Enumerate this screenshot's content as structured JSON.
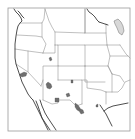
{
  "map": {
    "title": "",
    "colors": {
      "background": "#ffffff",
      "frame": "#9a9a9a",
      "state_border": "#8c8c8c",
      "coastline": "#3a3a3a",
      "shaded_region": "#6e6e6e",
      "lake": "#d8d8d8"
    },
    "frame": {
      "x": 8,
      "y": 8,
      "width": 122,
      "height": 123
    },
    "coastlines": [
      "M14,9 L16,12 L19,15 L21,18 L22,21 L20,23 L18,26 L17,30 L16,36 L15,44 L15,52 L15,58 L16,64 L18,70 L20,76 L22,82 L25,88 L28,94 L31,98 L33,100",
      "M18,11 L20,13 L22,16 L24,18",
      "M33,100 L36,106 L39,112 L42,118 L45,124 L48,130",
      "M36,101 L38,106 L40,112 L42,118 L46,124 L50,130",
      "M40,100 L42,106 L45,113 L48,118 L52,124 L56,130",
      "M87,9 L89,12 L92,14 L95,17 L97,20 L99,22",
      "M99,22 L102,23 L105,24 L108,25",
      "M100,105 L102,108 L104,111 L106,114 L108,118 L110,122 L112,126",
      "M104,111 L108,108 L113,106 L118,105 L123,104 L128,103"
    ],
    "lakes": [
      "M114,21 L118,19 L121,22 L123,26 L124,31 L122,35 L119,33 L117,28 L115,24 Z"
    ],
    "state_borders": [
      "M20,23 L42,23 L44,19 L45,9",
      "M17,35 L36,36 L42,37",
      "M42,23 L42,37 L46,44 L43,53",
      "M45,9 L49,21 L52,27 L55,32 L55,45",
      "M15,49 L28,51 L43,53",
      "M28,51 L28,72 L41,86",
      "M43,53 L55,53 L55,45",
      "M55,32 L85,33 L85,9",
      "M55,45 L58,45 L58,66 L85,66",
      "M58,45 L85,45 L85,66",
      "M85,33 L106,33",
      "M85,45 L107,45",
      "M85,66 L85,82 L105,82",
      "M85,9 L85,33",
      "M106,24 L106,33 L107,45 L110,56 L108,66 L112,74",
      "M58,66 L58,80",
      "M41,86 L43,80 L43,66 L58,66",
      "M43,80 L43,100",
      "M58,80 L82,80 L82,104",
      "M43,100 L52,104 L58,103 L58,100 L70,100 L76,106 L82,104",
      "M82,80 L87,80 L87,88 L101,90 L106,92",
      "M85,66 L108,66",
      "M106,92 L106,104",
      "M108,66 L112,74 L120,76 L124,82",
      "M106,92 L118,92 L122,88 L125,82 L130,80",
      "M112,74 L112,92",
      "M120,45 L126,54 L130,58",
      "M107,45 L120,45",
      "M110,56 L128,56",
      "M16,64 L28,72"
    ],
    "shaded_regions": [
      {
        "name": "central-california",
        "points": "20,74 24,72 27,73 26,76 22,77 20,76"
      },
      {
        "name": "northwest-nevada",
        "points": "49,58 51,57 52,60 50,61"
      },
      {
        "name": "central-arizona",
        "points": "46,84 48,82 51,84 52,87 50,89 47,88"
      },
      {
        "name": "southern-arizona",
        "points": "55,98 59,98 59,102 55,102"
      },
      {
        "name": "northern-new-mexico",
        "points": "71,80 73,80 73,83 71,83"
      },
      {
        "name": "southern-new-mexico",
        "points": "66,94 69,93 70,96 67,97"
      },
      {
        "name": "west-texas-1",
        "points": "75,103 78,105 80,108 79,111 77,110 75,107"
      },
      {
        "name": "west-texas-2",
        "points": "79,108 83,110 84,113 81,114 79,111"
      },
      {
        "name": "central-texas",
        "points": "96,105 98,104 98,107 96,107"
      }
    ]
  }
}
